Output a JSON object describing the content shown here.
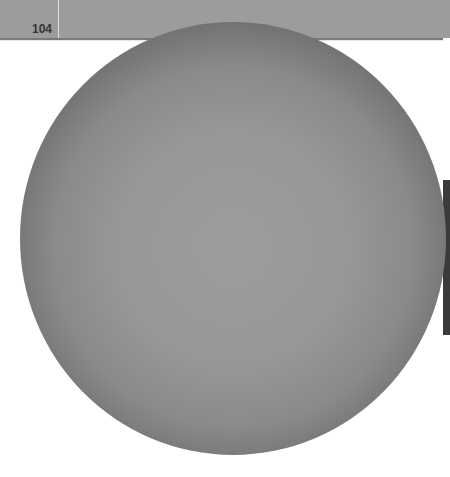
{
  "header": {
    "page_number": "104"
  },
  "figure": {
    "shape": "sphere",
    "colors": {
      "center": "#9d9d9d",
      "edge": "#2c2c2c",
      "header_band": "#9c9c9c"
    }
  }
}
